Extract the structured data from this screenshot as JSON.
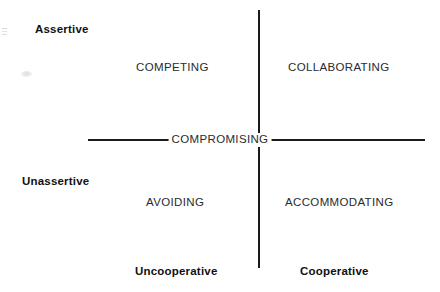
{
  "diagram": {
    "background_color": "#ffffff",
    "line_color": "#1a1a1a",
    "text_color": "#2b2b2b",
    "anchor_text_color": "#111111",
    "axes": {
      "vertical_name": "assertiveness-axis",
      "horizontal_name": "cooperativeness-axis"
    },
    "anchors": {
      "top_left": "Assertive",
      "middle_left": "Unassertive",
      "bottom_left": "Uncooperative",
      "bottom_right": "Cooperative"
    },
    "modes": {
      "upper_left": "COMPETING",
      "upper_right": "COLLABORATING",
      "center": "COMPROMISING",
      "lower_left": "AVOIDING",
      "lower_right": "ACCOMMODATING"
    }
  },
  "chart_data": {
    "type": "scatter",
    "xlabel": "Cooperativeness",
    "ylabel": "Assertiveness",
    "xlim": [
      0,
      1
    ],
    "ylim": [
      0,
      1
    ],
    "grid": false,
    "legend": "none",
    "x_tick_labels": [
      "Uncooperative",
      "Cooperative"
    ],
    "y_tick_labels": [
      "Unassertive",
      "Assertive"
    ],
    "categories": [
      "COMPETING",
      "COLLABORATING",
      "COMPROMISING",
      "AVOIDING",
      "ACCOMMODATING"
    ],
    "points": [
      {
        "label": "COMPETING",
        "x": 0.22,
        "y": 0.8,
        "quadrant": "upper-left"
      },
      {
        "label": "COLLABORATING",
        "x": 0.78,
        "y": 0.8,
        "quadrant": "upper-right"
      },
      {
        "label": "COMPROMISING",
        "x": 0.5,
        "y": 0.5,
        "quadrant": "center"
      },
      {
        "label": "AVOIDING",
        "x": 0.22,
        "y": 0.22,
        "quadrant": "lower-left"
      },
      {
        "label": "ACCOMMODATING",
        "x": 0.78,
        "y": 0.22,
        "quadrant": "lower-right"
      }
    ],
    "annotations": [
      "Assertive",
      "Unassertive",
      "Uncooperative",
      "Cooperative"
    ]
  }
}
